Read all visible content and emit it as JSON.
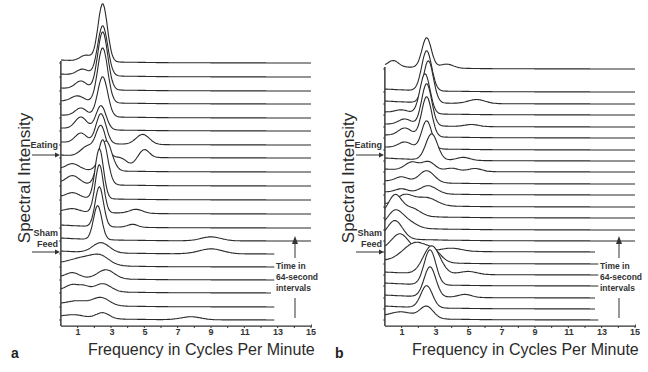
{
  "figure": {
    "x_axis_label": "Frequency in Cycles Per Minute",
    "y_axis_label": "Spectral Intensity",
    "time_note": [
      "Time in",
      "64-second",
      "intervals"
    ],
    "x_ticks": [
      "1",
      "3",
      "5",
      "7",
      "9",
      "11",
      "13",
      "15"
    ]
  },
  "panels": [
    {
      "letter": "a",
      "markers": [
        {
          "label": [
            "Eating"
          ],
          "trace_index": 12
        },
        {
          "label": [
            "Sham",
            "Feed"
          ],
          "trace_index": 5
        }
      ]
    },
    {
      "letter": "b",
      "markers": [
        {
          "label": [
            "Eating"
          ],
          "trace_index": 13
        },
        {
          "label": [
            "Sham",
            "Feed"
          ],
          "trace_index": 5
        }
      ]
    }
  ],
  "chart_data": [
    {
      "type": "line",
      "subtype": "stacked-spectra (waterfall)",
      "panel": "a",
      "title": "",
      "xlabel": "Frequency in Cycles Per Minute",
      "ylabel": "Spectral Intensity",
      "xlim": [
        0,
        15
      ],
      "x_ticks": [
        1,
        3,
        5,
        7,
        9,
        11,
        13,
        15
      ],
      "grid": false,
      "legend": null,
      "annotations": [
        "Eating",
        "Sham Feed",
        "Time in 64-second intervals (arrow pointing up)"
      ],
      "n_traces": 20,
      "trace_order": "bottom = earliest, top = latest",
      "traces": [
        {
          "i": 0,
          "baseline": 320,
          "xend": 12.8,
          "peaks": [
            [
              0.8,
              3,
              0.6
            ],
            [
              2.5,
              6,
              0.4
            ],
            [
              7.8,
              3,
              0.6
            ]
          ]
        },
        {
          "i": 1,
          "baseline": 307,
          "xend": 12.8,
          "peaks": [
            [
              1.0,
              4,
              0.6
            ],
            [
              2.4,
              8,
              0.5
            ]
          ]
        },
        {
          "i": 2,
          "baseline": 293,
          "xend": 12.6,
          "peaks": [
            [
              0.7,
              6,
              0.4
            ],
            [
              1.4,
              4,
              0.3
            ],
            [
              2.5,
              8,
              0.5
            ]
          ]
        },
        {
          "i": 3,
          "baseline": 280,
          "xend": 12.8,
          "peaks": [
            [
              0.7,
              5,
              0.4
            ],
            [
              2.7,
              9,
              0.5
            ]
          ]
        },
        {
          "i": 4,
          "baseline": 267,
          "xend": 12.8,
          "peaks": [
            [
              1.5,
              8,
              0.9
            ],
            [
              2.4,
              6,
              0.5
            ]
          ]
        },
        {
          "i": 5,
          "baseline": 254,
          "xend": 12.8,
          "peaks": [
            [
              2.4,
              10,
              0.5
            ],
            [
              9.0,
              5,
              0.7
            ]
          ]
        },
        {
          "i": 6,
          "baseline": 241,
          "xend": 15,
          "peaks": [
            [
              2.2,
              34,
              0.25
            ],
            [
              9.0,
              4,
              0.6
            ]
          ]
        },
        {
          "i": 7,
          "baseline": 228,
          "xend": 15,
          "peaks": [
            [
              2.3,
              40,
              0.25
            ],
            [
              4.3,
              3,
              0.3
            ]
          ]
        },
        {
          "i": 8,
          "baseline": 214,
          "xend": 15,
          "peaks": [
            [
              0.7,
              3,
              0.4
            ],
            [
              2.3,
              48,
              0.25
            ],
            [
              4.5,
              4,
              0.4
            ]
          ]
        },
        {
          "i": 9,
          "baseline": 200,
          "xend": 15,
          "peaks": [
            [
              0.7,
              5,
              0.4
            ],
            [
              2.3,
              50,
              0.25
            ]
          ]
        },
        {
          "i": 10,
          "baseline": 186,
          "xend": 15,
          "peaks": [
            [
              0.7,
              8,
              0.4
            ],
            [
              2.5,
              45,
              0.3
            ]
          ]
        },
        {
          "i": 11,
          "baseline": 172,
          "xend": 15,
          "peaks": [
            [
              0.7,
              6,
              0.4
            ],
            [
              2.7,
              30,
              0.35
            ]
          ]
        },
        {
          "i": 12,
          "baseline": 158,
          "xend": 15,
          "peaks": [
            [
              1.6,
              10,
              0.4
            ],
            [
              2.4,
              30,
              0.3
            ],
            [
              4.2,
              -6,
              0.3
            ],
            [
              5.0,
              8,
              0.3
            ]
          ]
        },
        {
          "i": 13,
          "baseline": 145,
          "xend": 15,
          "peaks": [
            [
              1.2,
              10,
              0.35
            ],
            [
              2.4,
              30,
              0.3
            ],
            [
              4.9,
              10,
              0.4
            ]
          ]
        },
        {
          "i": 14,
          "baseline": 131,
          "xend": 15,
          "peaks": [
            [
              1.2,
              12,
              0.35
            ],
            [
              2.4,
              24,
              0.3
            ]
          ]
        },
        {
          "i": 15,
          "baseline": 118,
          "xend": 15,
          "peaks": [
            [
              1.2,
              8,
              0.35
            ],
            [
              2.5,
              40,
              0.3
            ]
          ]
        },
        {
          "i": 16,
          "baseline": 104,
          "xend": 15,
          "peaks": [
            [
              1.0,
              6,
              0.4
            ],
            [
              2.5,
              55,
              0.3
            ]
          ]
        },
        {
          "i": 17,
          "baseline": 91,
          "xend": 15,
          "peaks": [
            [
              1.2,
              8,
              0.35
            ],
            [
              2.5,
              58,
              0.3
            ]
          ]
        },
        {
          "i": 18,
          "baseline": 77,
          "xend": 15,
          "peaks": [
            [
              1.3,
              6,
              0.35
            ],
            [
              2.5,
              50,
              0.3
            ]
          ]
        },
        {
          "i": 19,
          "baseline": 63,
          "xend": 15,
          "peaks": [
            [
              1.5,
              6,
              0.35
            ],
            [
              2.5,
              58,
              0.28
            ]
          ]
        }
      ]
    },
    {
      "type": "line",
      "subtype": "stacked-spectra (waterfall)",
      "panel": "b",
      "title": "",
      "xlabel": "Frequency in Cycles Per Minute",
      "ylabel": "Spectral Intensity",
      "xlim": [
        0,
        15
      ],
      "x_ticks": [
        1,
        3,
        5,
        7,
        9,
        11,
        13,
        15
      ],
      "grid": false,
      "legend": null,
      "annotations": [
        "Eating",
        "Sham Feed",
        "Time in 64-second intervals (arrow pointing up)"
      ],
      "n_traces": 22,
      "trace_order": "bottom = earliest, top = latest",
      "traces": [
        {
          "i": 0,
          "baseline": 320,
          "xend": 12.8,
          "peaks": [
            [
              1.0,
              6,
              0.7
            ],
            [
              2.5,
              12,
              0.4
            ]
          ]
        },
        {
          "i": 1,
          "baseline": 309,
          "xend": 12.6,
          "peaks": [
            [
              2.5,
              22,
              0.35
            ]
          ]
        },
        {
          "i": 2,
          "baseline": 298,
          "xend": 12.6,
          "peaks": [
            [
              2.7,
              30,
              0.35
            ],
            [
              4.8,
              3,
              0.4
            ]
          ]
        },
        {
          "i": 3,
          "baseline": 286,
          "xend": 12.8,
          "peaks": [
            [
              2.7,
              35,
              0.35
            ]
          ]
        },
        {
          "i": 4,
          "baseline": 275,
          "xend": 12.8,
          "peaks": [
            [
              2.8,
              28,
              0.5
            ],
            [
              5.0,
              3,
              0.5
            ]
          ]
        },
        {
          "i": 5,
          "baseline": 264,
          "xend": 12.8,
          "peaks": [
            [
              1.9,
              20,
              0.8
            ],
            [
              3.0,
              6,
              0.4
            ]
          ]
        },
        {
          "i": 6,
          "baseline": 252,
          "xend": 12.6,
          "peaks": [
            [
              0.9,
              16,
              0.5
            ],
            [
              4.0,
              3,
              0.6
            ]
          ]
        },
        {
          "i": 7,
          "baseline": 241,
          "xend": 15,
          "peaks": [
            [
              0.6,
              18,
              0.45
            ]
          ]
        },
        {
          "i": 8,
          "baseline": 230,
          "xend": 15,
          "peaks": [
            [
              0.6,
              16,
              0.45
            ],
            [
              1.4,
              6,
              0.5
            ]
          ]
        },
        {
          "i": 9,
          "baseline": 218,
          "xend": 15,
          "peaks": [
            [
              0.6,
              20,
              0.4
            ],
            [
              1.6,
              8,
              0.5
            ]
          ]
        },
        {
          "i": 10,
          "baseline": 207,
          "xend": 15,
          "peaks": [
            [
              1.2,
              10,
              0.5
            ],
            [
              2.5,
              8,
              0.6
            ]
          ]
        },
        {
          "i": 11,
          "baseline": 195,
          "xend": 15,
          "peaks": [
            [
              1.0,
              4,
              0.4
            ],
            [
              2.6,
              8,
              0.5
            ]
          ]
        },
        {
          "i": 12,
          "baseline": 184,
          "xend": 15,
          "peaks": [
            [
              1.0,
              5,
              0.4
            ],
            [
              2.5,
              12,
              0.45
            ]
          ]
        },
        {
          "i": 13,
          "baseline": 172,
          "xend": 15,
          "peaks": [
            [
              1.6,
              8,
              0.4
            ],
            [
              2.6,
              9,
              0.4
            ],
            [
              4.0,
              3,
              0.4
            ],
            [
              5.4,
              3,
              0.4
            ]
          ]
        },
        {
          "i": 14,
          "baseline": 161,
          "xend": 15,
          "peaks": [
            [
              2.8,
              26,
              0.35
            ],
            [
              4.7,
              3,
              0.4
            ]
          ]
        },
        {
          "i": 15,
          "baseline": 150,
          "xend": 15,
          "peaks": [
            [
              1.2,
              6,
              0.4
            ],
            [
              2.5,
              28,
              0.3
            ]
          ]
        },
        {
          "i": 16,
          "baseline": 138,
          "xend": 15,
          "peaks": [
            [
              1.2,
              8,
              0.4
            ],
            [
              2.5,
              40,
              0.3
            ]
          ]
        },
        {
          "i": 17,
          "baseline": 127,
          "xend": 15,
          "peaks": [
            [
              1.2,
              6,
              0.4
            ],
            [
              2.5,
              42,
              0.3
            ],
            [
              5.2,
              2,
              0.4
            ]
          ]
        },
        {
          "i": 18,
          "baseline": 115,
          "xend": 15,
          "peaks": [
            [
              1.0,
              3,
              0.4
            ],
            [
              2.4,
              40,
              0.3
            ]
          ]
        },
        {
          "i": 19,
          "baseline": 104,
          "xend": 15,
          "peaks": [
            [
              2.6,
              42,
              0.3
            ],
            [
              5.5,
              4,
              0.5
            ]
          ]
        },
        {
          "i": 20,
          "baseline": 92,
          "xend": 15,
          "peaks": [
            [
              2.5,
              40,
              0.3
            ]
          ]
        },
        {
          "i": 21,
          "baseline": 69,
          "xend": 15,
          "peaks": [
            [
              0.5,
              6,
              0.3
            ],
            [
              2.5,
              30,
              0.28
            ],
            [
              3.7,
              4,
              0.4
            ]
          ]
        }
      ]
    }
  ]
}
